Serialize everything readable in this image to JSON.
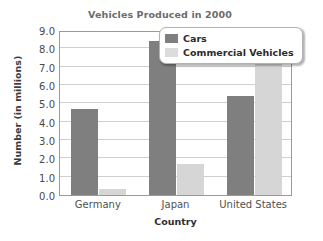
{
  "chart_data": {
    "type": "bar",
    "title": "Vehicles Produced in 2000",
    "xlabel": "Country",
    "ylabel": "Number (in millions)",
    "categories": [
      "Germany",
      "Japan",
      "United States"
    ],
    "series": [
      {
        "name": "Cars",
        "values": [
          4.7,
          8.4,
          5.4
        ],
        "color": "#7f7f7f"
      },
      {
        "name": "Commercial Vehicles",
        "values": [
          0.35,
          1.7,
          7.15
        ],
        "color": "#d6d6d6"
      }
    ],
    "ylim": [
      0.0,
      9.0
    ],
    "ytick_labels": [
      "9.0",
      "8.0",
      "7.0",
      "6.0",
      "5.0",
      "4.0",
      "3.0",
      "2.0",
      "1.0",
      "0.0"
    ],
    "ytick_values": [
      9.0,
      8.0,
      7.0,
      6.0,
      5.0,
      4.0,
      3.0,
      2.0,
      1.0,
      0.0
    ],
    "grid": true,
    "legend_position": "top-right"
  }
}
